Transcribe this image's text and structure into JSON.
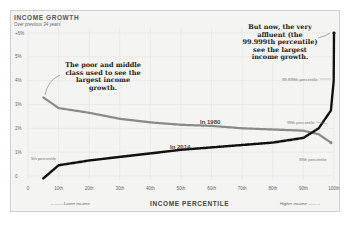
{
  "chart_data": {
    "type": "line",
    "title": "INCOME GROWTH",
    "subtitle": "Over previous 34 years",
    "xlabel": "INCOME PERCENTILE",
    "ylabel": "",
    "xlim": [
      0,
      100
    ],
    "ylim": [
      0,
      6
    ],
    "grid": true,
    "x_ticks": [
      "0",
      "10th",
      "20th",
      "30th",
      "40th",
      "50th",
      "60th",
      "70th",
      "80th",
      "90th",
      "100th"
    ],
    "y_ticks": [
      "0",
      "1%",
      "2%",
      "3%",
      "4%",
      "5%",
      "+6%"
    ],
    "series": [
      {
        "name": "In 1980",
        "color": "#8a8a8a",
        "x": [
          5,
          10,
          20,
          30,
          40,
          50,
          60,
          70,
          80,
          90,
          95,
          99
        ],
        "values": [
          3.3,
          2.85,
          2.65,
          2.4,
          2.25,
          2.15,
          2.1,
          2.0,
          1.95,
          1.9,
          1.75,
          1.4
        ]
      },
      {
        "name": "In 2014",
        "color": "#111111",
        "x": [
          5,
          10,
          20,
          30,
          40,
          50,
          60,
          70,
          80,
          90,
          95,
          99,
          99.9,
          99.999
        ],
        "values": [
          -0.1,
          0.45,
          0.65,
          0.8,
          0.95,
          1.1,
          1.2,
          1.3,
          1.4,
          1.6,
          2.0,
          2.75,
          4.0,
          6.0
        ]
      }
    ],
    "annotations": [
      "The poor and middle class used to see the largest income growth.",
      "But now, the very affluent (the 99.999th percentile) see the largest income growth.",
      "5th percentile",
      "99.999th percentile",
      "99th percentile",
      "99th percentile"
    ],
    "footer": {
      "left": "Lower income",
      "right": "Higher income"
    }
  },
  "labels": {
    "title": "INCOME GROWTH",
    "subtitle": "Over previous 34 years",
    "annot_left": "The poor and middle class used to see the largest income growth.",
    "annot_right": "But now, the very affluent (the 99.999th percentile) see the largest income growth.",
    "series_1980": "In 1980",
    "series_2014": "In 2014",
    "pct_5": "5th percentile",
    "pct_99999": "99.999th percentile",
    "pct_99_top": "99th percentile",
    "pct_99_bottom": "99th percentile",
    "axis_title": "INCOME PERCENTILE",
    "foot_left": "Lower income",
    "foot_right": "Higher income"
  }
}
